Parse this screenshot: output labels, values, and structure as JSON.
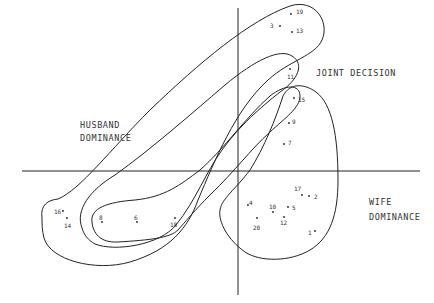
{
  "regions": {
    "husband": {
      "line1": "HUSBAND",
      "line2": "DOMINANCE"
    },
    "joint": {
      "label": "JOINT DECISION"
    },
    "wife": {
      "line1": "WIFE",
      "line2": "DOMINANCE"
    }
  },
  "points": [
    {
      "id": "19",
      "x": 291,
      "y": 14,
      "lx": 296,
      "ly": 8
    },
    {
      "id": "3",
      "x": 280,
      "y": 26,
      "lx": 270,
      "ly": 22
    },
    {
      "id": "13",
      "x": 292,
      "y": 32,
      "lx": 296,
      "ly": 27
    },
    {
      "id": "11",
      "x": 290,
      "y": 69,
      "lx": 287,
      "ly": 73
    },
    {
      "id": "15",
      "x": 294,
      "y": 98,
      "lx": 298,
      "ly": 96
    },
    {
      "id": "9",
      "x": 289,
      "y": 123,
      "lx": 292,
      "ly": 118
    },
    {
      "id": "7",
      "x": 284,
      "y": 144,
      "lx": 288,
      "ly": 139
    },
    {
      "id": "17",
      "x": 302,
      "y": 195,
      "lx": 294,
      "ly": 185
    },
    {
      "id": "2",
      "x": 309,
      "y": 196,
      "lx": 314,
      "ly": 193
    },
    {
      "id": "4",
      "x": 248,
      "y": 205,
      "lx": 249,
      "ly": 199
    },
    {
      "id": "10",
      "x": 273,
      "y": 212,
      "lx": 269,
      "ly": 203
    },
    {
      "id": "5",
      "x": 288,
      "y": 207,
      "lx": 292,
      "ly": 204
    },
    {
      "id": "12",
      "x": 284,
      "y": 217,
      "lx": 280,
      "ly": 219
    },
    {
      "id": "20",
      "x": 257,
      "y": 218,
      "lx": 253,
      "ly": 224
    },
    {
      "id": "1",
      "x": 315,
      "y": 231,
      "lx": 308,
      "ly": 229
    },
    {
      "id": "16",
      "x": 63,
      "y": 211,
      "lx": 54,
      "ly": 208
    },
    {
      "id": "14",
      "x": 67,
      "y": 218,
      "lx": 64,
      "ly": 222
    },
    {
      "id": "8",
      "x": 102,
      "y": 222,
      "lx": 99,
      "ly": 214
    },
    {
      "id": "6",
      "x": 137,
      "y": 222,
      "lx": 134,
      "ly": 214
    },
    {
      "id": "18",
      "x": 175,
      "y": 218,
      "lx": 170,
      "ly": 221
    }
  ]
}
